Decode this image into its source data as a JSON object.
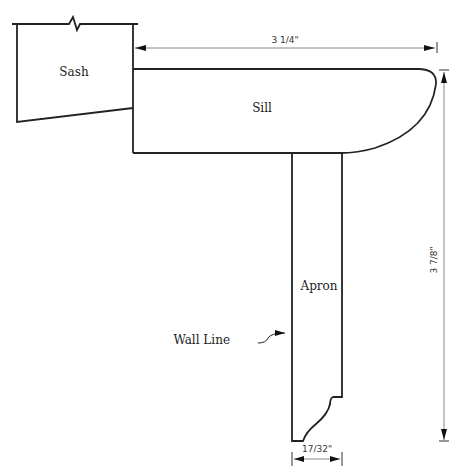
{
  "diagram": {
    "labels": {
      "sash": "Sash",
      "sill": "Sill",
      "apron": "Apron",
      "wall_line": "Wall Line"
    },
    "dimensions": {
      "sill_width": "3 1/4\"",
      "apron_height": "3 7/8\"",
      "apron_thickness": "17/32\""
    },
    "colors": {
      "outline": "#222222",
      "dimension_line": "#888888"
    }
  }
}
